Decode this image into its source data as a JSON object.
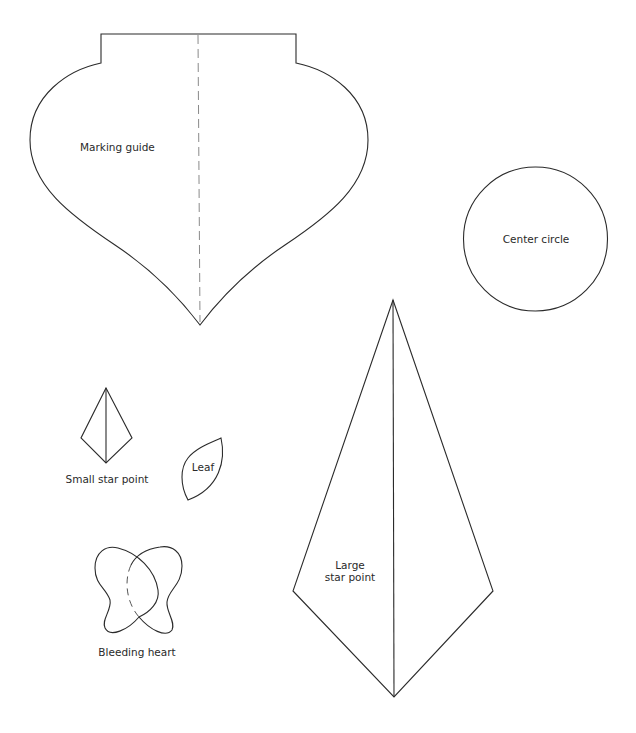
{
  "colors": {
    "background": "#ffffff",
    "outline": "#2b2b2b",
    "fold_line": "#8a8a8a",
    "text": "#2a2a2a"
  },
  "templates": {
    "marking_guide": {
      "label": "Marking guide"
    },
    "center_circle": {
      "label": "Center circle"
    },
    "small_star_point": {
      "label": "Small star point"
    },
    "leaf": {
      "label": "Leaf"
    },
    "large_star_point": {
      "label_line1": "Large",
      "label_line2": "star point"
    },
    "bleeding_heart": {
      "label": "Bleeding heart"
    }
  }
}
